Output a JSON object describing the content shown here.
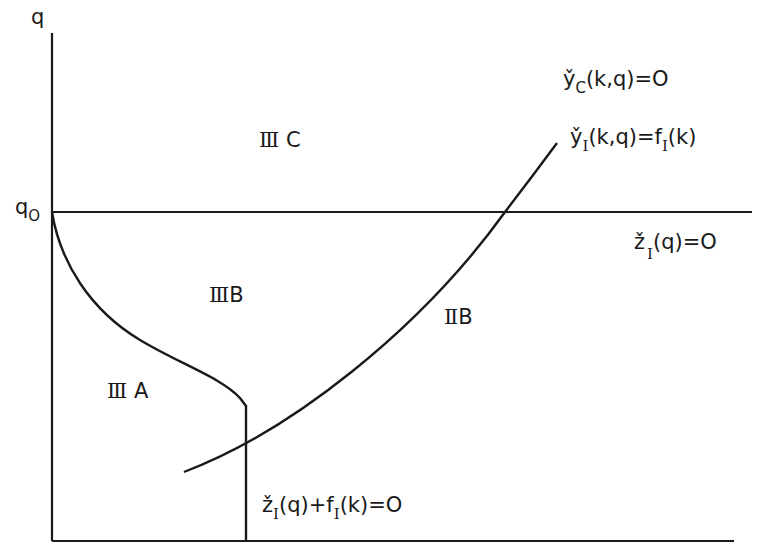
{
  "diagram": {
    "axes": {
      "y_label": "q",
      "y_marker": "q",
      "y_marker_sub": "O"
    },
    "regions": [
      {
        "id": "IIIC",
        "roman": "Ⅲ",
        "letter": "C"
      },
      {
        "id": "IIIB",
        "roman": "Ⅲ",
        "letter": "B"
      },
      {
        "id": "IIIA",
        "roman": "Ⅲ",
        "letter": "A"
      },
      {
        "id": "IIB",
        "roman": "Ⅱ",
        "letter": "B"
      }
    ],
    "curve_labels": {
      "yc": {
        "base": "y̌",
        "sub": "C",
        "rest": "(k,q)=O"
      },
      "yi": {
        "base": "y̌",
        "sub": "I",
        "rest": "(k,q)=f",
        "sub2": "I",
        "rest2": "(k)"
      },
      "zi": {
        "base": "ž",
        "sub": "I",
        "rest": "(q)=O"
      },
      "zf": {
        "base": "ž",
        "sub": "I",
        "rest": "(q)+f",
        "sub2": "I",
        "rest2": "(k)=O"
      }
    },
    "colors": {
      "line": "#1a1a1a",
      "background": "#ffffff"
    }
  }
}
